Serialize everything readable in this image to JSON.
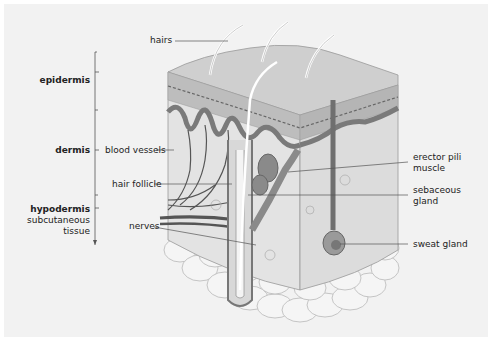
{
  "diagram": {
    "layers": [
      {
        "name": "epidermis"
      },
      {
        "name": "dermis"
      },
      {
        "name": "hypodermis",
        "subtitle_line1": "subcutaneous",
        "subtitle_line2": "tissue"
      }
    ],
    "labels": {
      "hairs": "hairs",
      "blood_vessels": "blood vessels",
      "hair_follicle": "hair follicle",
      "nerves": "nerves",
      "erector_pili_line1": "erector pili",
      "erector_pili_line2": "muscle",
      "sebaceous_line1": "sebaceous",
      "sebaceous_line2": "gland",
      "sweat_gland": "sweat gland"
    },
    "colors": {
      "background": "#f2f2f2",
      "skin_top": "#cfcfcf",
      "dermis": "#e0e0e0",
      "dark": "#777777",
      "fat": "#f4f4f4"
    }
  }
}
